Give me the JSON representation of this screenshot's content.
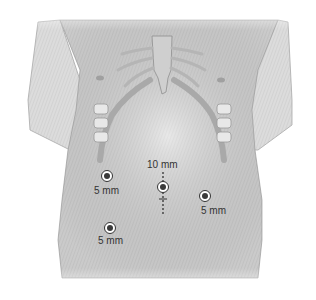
{
  "figure": {
    "colors": {
      "background": "#ffffff",
      "skin": "#d9d9d9",
      "skin_light": "#ececec",
      "bone": "#c4c4c4",
      "outline": "#9a9a9a",
      "port_ring": "#ffffff",
      "port_dot": "#3a3a3a",
      "text": "#333333"
    },
    "ports": [
      {
        "id": "port-left-upper",
        "size_label": "5 mm",
        "cx": 107,
        "cy": 176,
        "label_x": 94,
        "label_y": 186
      },
      {
        "id": "port-umbilical",
        "size_label": "10 mm",
        "cx": 163,
        "cy": 187,
        "label_x": 147,
        "label_y": 160
      },
      {
        "id": "port-right",
        "size_label": "5 mm",
        "cx": 205,
        "cy": 196,
        "label_x": 201,
        "label_y": 206
      },
      {
        "id": "port-left-lower",
        "size_label": "5 mm",
        "cx": 110,
        "cy": 228,
        "label_x": 98,
        "label_y": 236
      }
    ]
  }
}
